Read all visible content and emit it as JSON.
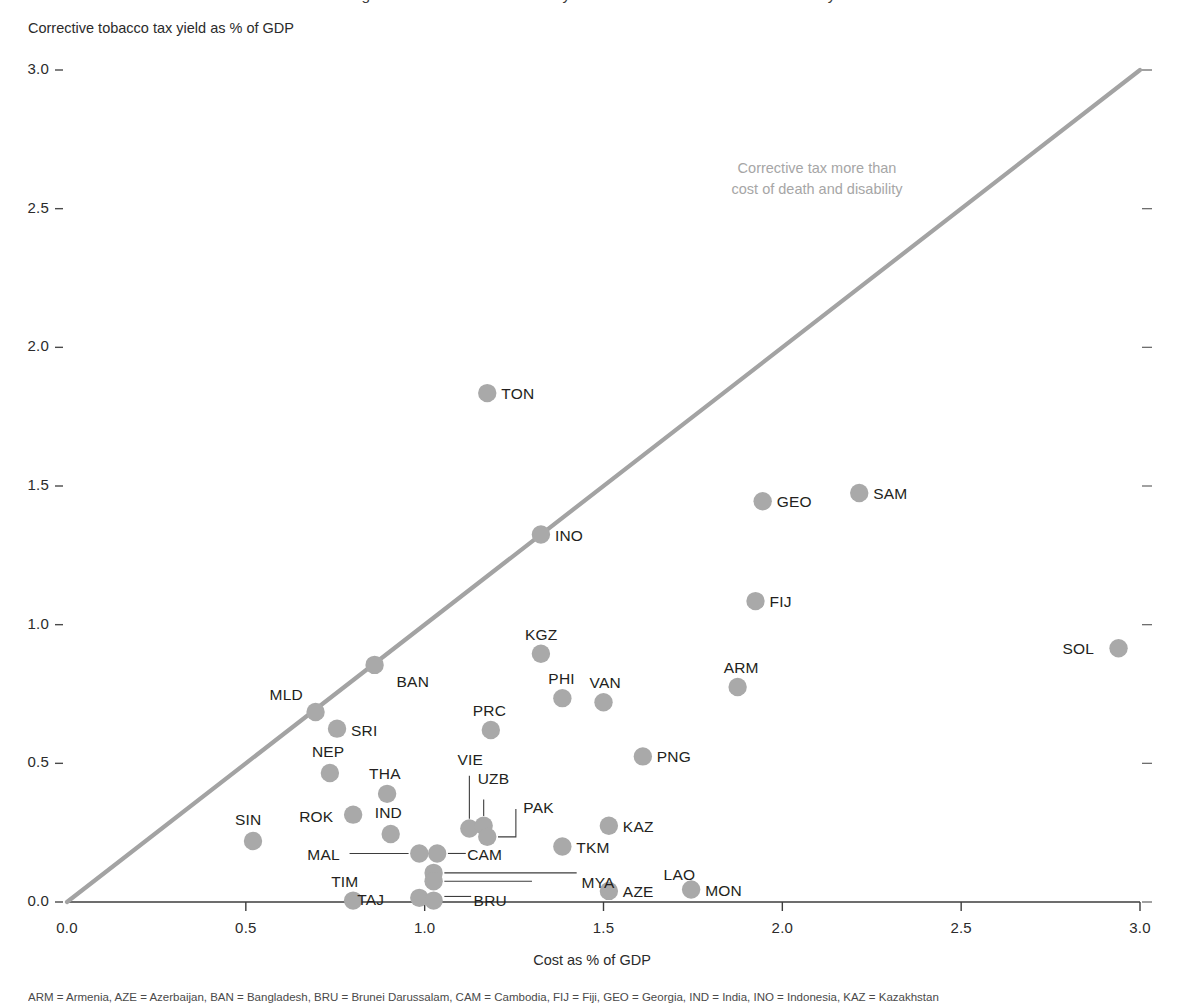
{
  "figure": {
    "title_cut": "Figure: Corrective tobacco tax yield versus cost of death and disability",
    "footnote_cut": "ARM = Armenia, AZE = Azerbaijan, BAN = Bangladesh, BRU = Brunei Darussalam, CAM = Cambodia, FIJ = Fiji, GEO = Georgia, IND = India, INO = Indonesia, KAZ = Kazakhstan"
  },
  "chart_data": {
    "type": "scatter",
    "title": "",
    "xlabel": "Cost as % of GDP",
    "ylabel": "Corrective tobacco tax yield as % of GDP",
    "xlim": [
      0.0,
      3.0
    ],
    "ylim": [
      0.0,
      3.0
    ],
    "xticks": [
      "0.0",
      "0.5",
      "1.0",
      "1.5",
      "2.0",
      "2.5",
      "3.0"
    ],
    "yticks": [
      "0.0",
      "0.5",
      "1.0",
      "1.5",
      "2.0",
      "2.5",
      "3.0"
    ],
    "grid": false,
    "legend": "none",
    "marker_color": "#a9a9a9",
    "line_color": "#a3a3a3",
    "reference_line": {
      "name": "parity-line",
      "from": [
        0.0,
        0.0
      ],
      "to": [
        3.0,
        3.0
      ]
    },
    "annotations": [
      {
        "name": "corrective-tax-note",
        "line1": "Corrective tax more than",
        "line2": "cost of death and disability",
        "x": 2.1,
        "y": 2.55
      }
    ],
    "points": [
      {
        "code": "TON",
        "x": 1.175,
        "y": 1.835,
        "label_dx": 14,
        "label_dy": -8,
        "leader": null
      },
      {
        "code": "SAM",
        "x": 2.215,
        "y": 1.475,
        "label_dx": 14,
        "label_dy": -8,
        "leader": null
      },
      {
        "code": "GEO",
        "x": 1.945,
        "y": 1.445,
        "label_dx": 14,
        "label_dy": -8,
        "leader": null
      },
      {
        "code": "INO",
        "x": 1.325,
        "y": 1.325,
        "label_dx": 14,
        "label_dy": -8,
        "leader": null
      },
      {
        "code": "FIJ",
        "x": 1.925,
        "y": 1.085,
        "label_dx": 14,
        "label_dy": -8,
        "leader": null
      },
      {
        "code": "SOL",
        "x": 2.94,
        "y": 0.915,
        "label_dx": -56,
        "label_dy": -8,
        "leader": null
      },
      {
        "code": "KGZ",
        "x": 1.325,
        "y": 0.895,
        "label_dx": -16,
        "label_dy": -28,
        "leader": null
      },
      {
        "code": "BAN",
        "x": 0.86,
        "y": 0.855,
        "label_dx": 22,
        "label_dy": 8,
        "leader": null
      },
      {
        "code": "ARM",
        "x": 1.875,
        "y": 0.775,
        "label_dx": -14,
        "label_dy": -28,
        "leader": null
      },
      {
        "code": "PHI",
        "x": 1.385,
        "y": 0.735,
        "label_dx": -14,
        "label_dy": -28,
        "leader": null
      },
      {
        "code": "VAN",
        "x": 1.5,
        "y": 0.72,
        "label_dx": -14,
        "label_dy": -28,
        "leader": null
      },
      {
        "code": "MLD",
        "x": 0.695,
        "y": 0.685,
        "label_dx": -46,
        "label_dy": -26,
        "leader": null
      },
      {
        "code": "PRC",
        "x": 1.185,
        "y": 0.62,
        "label_dx": -18,
        "label_dy": -28,
        "leader": null
      },
      {
        "code": "SRI",
        "x": 0.755,
        "y": 0.625,
        "label_dx": 14,
        "label_dy": -7,
        "leader": null
      },
      {
        "code": "PNG",
        "x": 1.61,
        "y": 0.525,
        "label_dx": 14,
        "label_dy": -8,
        "leader": null
      },
      {
        "code": "NEP",
        "x": 0.735,
        "y": 0.465,
        "label_dx": -18,
        "label_dy": -30,
        "leader": null
      },
      {
        "code": "THA",
        "x": 0.895,
        "y": 0.39,
        "label_dx": -18,
        "label_dy": -29,
        "leader": null
      },
      {
        "code": "VIE",
        "x": 1.125,
        "y": 0.265,
        "label_dx": -12,
        "label_dy": -78,
        "leader": {
          "x1": 1.125,
          "y1": 0.3,
          "x2": 1.125,
          "y2": 0.455
        }
      },
      {
        "code": "UZB",
        "x": 1.165,
        "y": 0.275,
        "label_dx": -6,
        "label_dy": -56,
        "leader": {
          "x1": 1.165,
          "y1": 0.31,
          "x2": 1.165,
          "y2": 0.37
        }
      },
      {
        "code": "ROK",
        "x": 0.8,
        "y": 0.315,
        "label_dx": -54,
        "label_dy": -7,
        "leader": null
      },
      {
        "code": "PAK",
        "x": 1.175,
        "y": 0.235,
        "label_dx": 36,
        "label_dy": -38,
        "leader": {
          "x1": 1.205,
          "y1": 0.235,
          "x2": 1.255,
          "y2": 0.235,
          "x3": 1.255,
          "y3": 0.335
        }
      },
      {
        "code": "KAZ",
        "x": 1.515,
        "y": 0.275,
        "label_dx": 14,
        "label_dy": -8,
        "leader": null
      },
      {
        "code": "IND",
        "x": 0.905,
        "y": 0.245,
        "label_dx": -16,
        "label_dy": -30,
        "leader": null
      },
      {
        "code": "SIN",
        "x": 0.52,
        "y": 0.22,
        "label_dx": -18,
        "label_dy": -30,
        "leader": null
      },
      {
        "code": "TKM",
        "x": 1.385,
        "y": 0.2,
        "label_dx": 14,
        "label_dy": -8,
        "leader": null
      },
      {
        "code": "MAL",
        "x": 0.985,
        "y": 0.175,
        "label_dx": -112,
        "label_dy": -7,
        "leader": {
          "x1": 0.955,
          "y1": 0.175,
          "x2": 0.79,
          "y2": 0.175
        }
      },
      {
        "code": "CAM",
        "x": 1.035,
        "y": 0.175,
        "label_dx": 30,
        "label_dy": -7,
        "leader": {
          "x1": 1.065,
          "y1": 0.175,
          "x2": 1.115,
          "y2": 0.175
        }
      },
      {
        "code": "LAO",
        "x": 1.025,
        "y": 0.105,
        "label_dx": 230,
        "label_dy": -7,
        "leader": {
          "x1": 1.055,
          "y1": 0.105,
          "x2": 1.425,
          "y2": 0.105
        }
      },
      {
        "code": "MYA",
        "x": 1.025,
        "y": 0.075,
        "label_dx": 148,
        "label_dy": -7,
        "leader": {
          "x1": 1.055,
          "y1": 0.075,
          "x2": 1.3,
          "y2": 0.075
        }
      },
      {
        "code": "TAJ",
        "x": 0.985,
        "y": 0.015,
        "label_dx": -62,
        "label_dy": -7,
        "leader": null
      },
      {
        "code": "BRU",
        "x": 1.025,
        "y": 0.005,
        "label_dx": 40,
        "label_dy": -9,
        "leader": {
          "x1": 1.055,
          "y1": 0.02,
          "x2": 1.13,
          "y2": 0.02
        }
      },
      {
        "code": "TIM",
        "x": 0.8,
        "y": 0.005,
        "label_dx": -22,
        "label_dy": -28,
        "leader": null
      },
      {
        "code": "AZE",
        "x": 1.515,
        "y": 0.04,
        "label_dx": 14,
        "label_dy": -8,
        "leader": null
      },
      {
        "code": "MON",
        "x": 1.745,
        "y": 0.045,
        "label_dx": 14,
        "label_dy": -8,
        "leader": null
      }
    ]
  }
}
